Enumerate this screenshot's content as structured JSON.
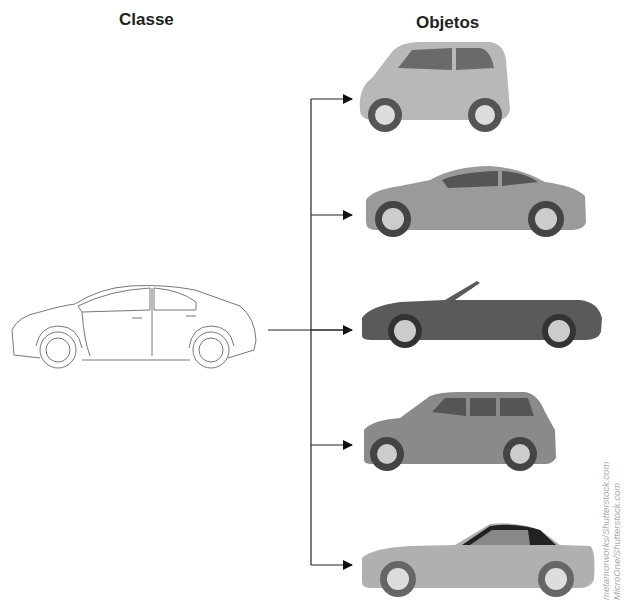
{
  "headings": {
    "class": "Classe",
    "objects": "Objetos"
  },
  "class_item": {
    "label": "sedan outline drawing",
    "style": "line-art"
  },
  "objects": [
    {
      "label": "compact car",
      "color": "#b8b8b8"
    },
    {
      "label": "coupe",
      "color": "#9a9a9a"
    },
    {
      "label": "convertible",
      "color": "#5a5a5a"
    },
    {
      "label": "suv",
      "color": "#8a8a8a"
    },
    {
      "label": "roadster",
      "color": "#b0b0b0"
    }
  ],
  "credits": {
    "line1": "metamorworks/Shutterstock.com",
    "line2": "MicroOne/Shutterstock.com"
  }
}
